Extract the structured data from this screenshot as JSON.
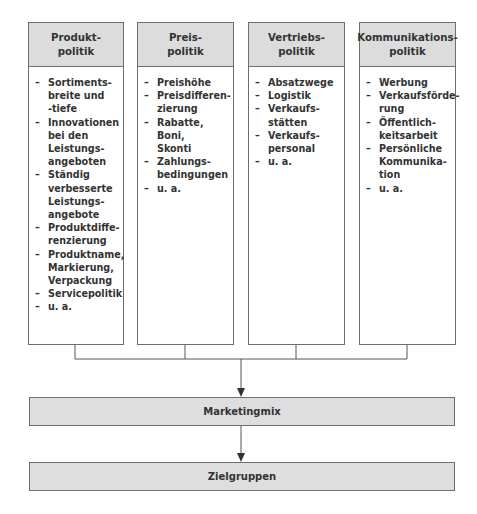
{
  "diagram": {
    "columns": [
      {
        "title": "Produkt-\npolitik",
        "items": [
          "Sortiments-\nbreite und\n-tiefe",
          "Innovationen\nbei den\nLeistungs-\nangeboten",
          "Ständig\nverbesserte\nLeistungs-\nangebote",
          "Produktdiffe-\nrenzierung",
          "Produktname,\nMarkierung,\nVerpackung",
          "Servicepolitik",
          "u. a."
        ]
      },
      {
        "title": "Preis-\npolitik",
        "items": [
          "Preishöhe",
          "Preisdifferen-\nzierung",
          "Rabatte, Boni,\nSkonti",
          "Zahlungs-\nbedingungen",
          "u. a."
        ]
      },
      {
        "title": "Vertriebs-\npolitik",
        "items": [
          "Absatzwege",
          "Logistik",
          "Verkaufs-\nstätten",
          "Verkaufs-\npersonal",
          "u. a."
        ]
      },
      {
        "title": "Kommunikations-\npolitik",
        "items": [
          "Werbung",
          "Verkaufsförde-\nrung",
          "Öffentlich-\nkeitsarbeit",
          "Persönliche\nKommunika-\ntion",
          "u. a."
        ]
      }
    ],
    "middle_box": "Marketingmix",
    "bottom_box": "Zielgruppen",
    "icons": {
      "arrow": "arrow-down-icon"
    },
    "colors": {
      "header_fill": "#dcdcdc",
      "border": "#6e6e6e",
      "line": "#555555"
    }
  }
}
